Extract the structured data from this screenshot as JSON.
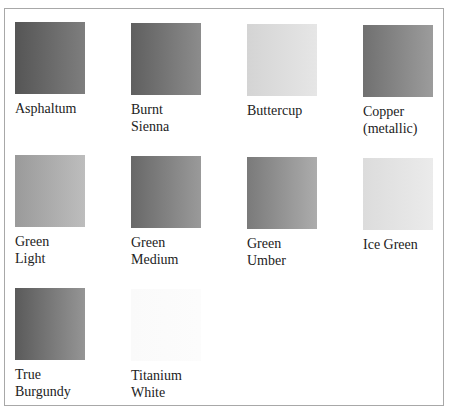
{
  "swatches": [
    {
      "name": "Asphaltum",
      "lines": "Asphaltum",
      "from": "#555555",
      "to": "#7e7e7e",
      "x": 12,
      "y": 14
    },
    {
      "name": "Burnt Sienna",
      "lines": "Burnt\nSienna",
      "from": "#5f5f5f",
      "to": "#8c8c8c",
      "x": 128,
      "y": 15
    },
    {
      "name": "Buttercup",
      "lines": "Buttercup",
      "from": "#d4d4d4",
      "to": "#e6e6e6",
      "x": 244,
      "y": 16
    },
    {
      "name": "Copper (metallic)",
      "lines": "Copper\n(metallic)",
      "from": "#707070",
      "to": "#9c9c9c",
      "x": 360,
      "y": 17
    },
    {
      "name": "Green Light",
      "lines": "Green\nLight",
      "from": "#9a9a9a",
      "to": "#bdbdbd",
      "x": 12,
      "y": 147
    },
    {
      "name": "Green Medium",
      "lines": "Green\nMedium",
      "from": "#686868",
      "to": "#9a9a9a",
      "x": 128,
      "y": 148
    },
    {
      "name": "Green Umber",
      "lines": "Green\nUmber",
      "from": "#7a7a7a",
      "to": "#acacac",
      "x": 244,
      "y": 149
    },
    {
      "name": "Ice Green",
      "lines": "Ice Green",
      "from": "#dcdcdc",
      "to": "#ebebeb",
      "x": 360,
      "y": 150
    },
    {
      "name": "True Burgundy",
      "lines": "True\nBurgundy",
      "from": "#5a5a5a",
      "to": "#959595",
      "x": 12,
      "y": 280
    },
    {
      "name": "Titanium White",
      "lines": "Titanium\nWhite",
      "from": "#fafafa",
      "to": "#fcfcfc",
      "x": 128,
      "y": 281
    }
  ]
}
